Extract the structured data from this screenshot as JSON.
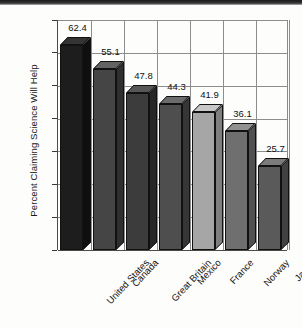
{
  "chart_data": {
    "type": "bar",
    "title": "",
    "subtitle": "",
    "xlabel": "",
    "ylabel": "Percent Claiming Science Will Help",
    "ylim": [
      0,
      70
    ],
    "yticks": [
      0,
      10,
      20,
      30,
      40,
      50,
      60,
      70
    ],
    "ytick_labels": [
      "0",
      "10",
      "20",
      "30",
      "40",
      "50",
      "60",
      "70"
    ],
    "grid": "both",
    "legend": "none",
    "style": "3d-bar",
    "categories": [
      "United States",
      "Canada",
      "Great Britain",
      "Mexico",
      "France",
      "Norway",
      "Japan"
    ],
    "values": [
      62.4,
      55.1,
      47.8,
      44.3,
      41.9,
      36.1,
      25.7
    ],
    "value_labels": [
      "62.4",
      "55.1",
      "47.8",
      "44.3",
      "41.9",
      "36.1",
      "25.7"
    ],
    "bar_colors": [
      "#1d1d1d",
      "#454545",
      "#3c3c3c",
      "#4e4e4e",
      "#a6a6a6",
      "#6f6f6f",
      "#5a5a5a"
    ],
    "bar_top_colors": [
      "#343434",
      "#636363",
      "#575757",
      "#6c6c6c",
      "#c8c8c8",
      "#919191",
      "#7b7b7b"
    ],
    "bar_side_colors": [
      "#0f0f0f",
      "#2f2f2f",
      "#272727",
      "#363636",
      "#7f7f7f",
      "#515151",
      "#414141"
    ]
  }
}
